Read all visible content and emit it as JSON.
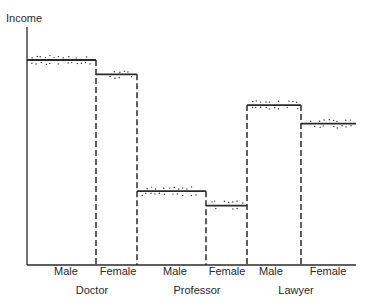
{
  "chart_data": {
    "type": "bar",
    "title": "",
    "xlabel": "",
    "ylabel": "Income",
    "groups": [
      "Doctor",
      "Professor",
      "Lawyer"
    ],
    "categories": [
      "Male",
      "Female",
      "Male",
      "Female",
      "Male",
      "Female"
    ],
    "bars": [
      {
        "group": "Doctor",
        "sex": "Male",
        "value": 100
      },
      {
        "group": "Doctor",
        "sex": "Female",
        "value": 93
      },
      {
        "group": "Professor",
        "sex": "Male",
        "value": 36
      },
      {
        "group": "Professor",
        "sex": "Female",
        "value": 29
      },
      {
        "group": "Lawyer",
        "sex": "Male",
        "value": 78
      },
      {
        "group": "Lawyer",
        "sex": "Female",
        "value": 69
      }
    ],
    "ylim": [
      0,
      100
    ],
    "grid": false,
    "legend": null
  },
  "axis": {
    "ylabel": "Income"
  },
  "labels": {
    "categories": [
      "Male",
      "Female",
      "Male",
      "Female",
      "Male",
      "Female"
    ],
    "groups": [
      "Doctor",
      "Professor",
      "Lawyer"
    ]
  },
  "colors": {
    "ink": "#2a2a2a",
    "background": "#ffffff"
  }
}
